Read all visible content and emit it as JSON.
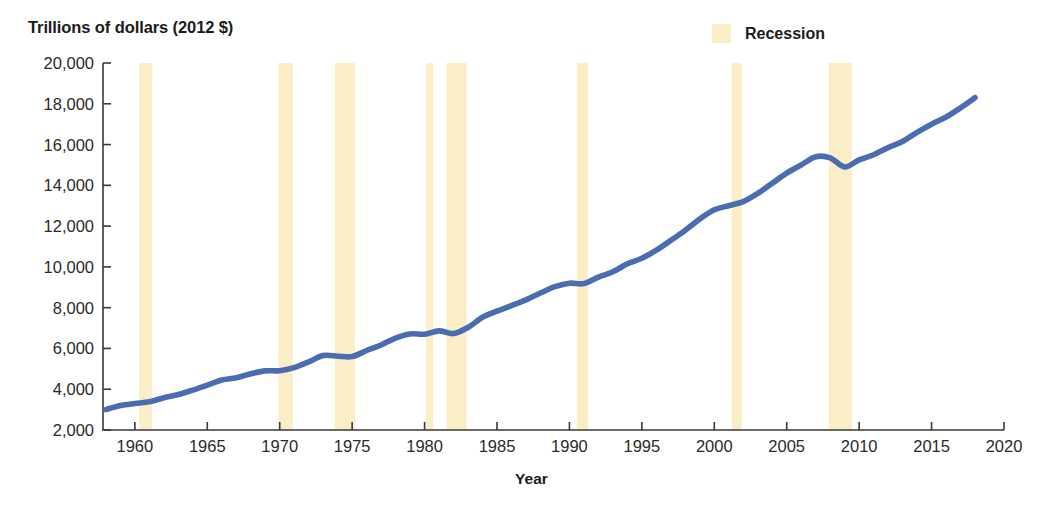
{
  "figure": {
    "y_axis_caption": "Trillions of dollars (2012 $)",
    "x_axis_title": "Year"
  },
  "legend": {
    "items": [
      {
        "label": "Recession",
        "color": "#fbeec6",
        "name": "recession"
      }
    ]
  },
  "colors": {
    "line": "#4a6cb0",
    "recession_band": "#fbeec6",
    "axis": "#3a3a3a",
    "text": "#1b1b1b"
  },
  "chart_data": {
    "type": "line",
    "title": "",
    "subtitle": "",
    "xlabel": "Year",
    "ylabel": "Trillions of dollars (2012 $)",
    "xlim": [
      1957,
      2020
    ],
    "ylim": [
      2000,
      20000
    ],
    "grid": false,
    "legend_position": "top-right",
    "y_tick_labels": [
      "20,000",
      "18,000",
      "16,000",
      "14,000",
      "12,000",
      "10,000",
      "8,000",
      "6,000",
      "4,000",
      "2,000"
    ],
    "y_ticks": [
      20000,
      18000,
      16000,
      14000,
      12000,
      10000,
      8000,
      6000,
      4000,
      2000
    ],
    "x_tick_labels": [
      "1960",
      "1965",
      "1970",
      "1975",
      "1980",
      "1985",
      "1990",
      "1995",
      "2000",
      "2005",
      "2010",
      "2015",
      "2020"
    ],
    "x_ticks": [
      1960,
      1965,
      1970,
      1975,
      1980,
      1985,
      1990,
      1995,
      2000,
      2005,
      2010,
      2015,
      2020
    ],
    "series": [
      {
        "name": "Real GDP",
        "color": "#4a6cb0",
        "x": [
          1958,
          1959,
          1960,
          1961,
          1962,
          1963,
          1964,
          1965,
          1966,
          1967,
          1968,
          1969,
          1970,
          1971,
          1972,
          1973,
          1974,
          1975,
          1976,
          1977,
          1978,
          1979,
          1980,
          1981,
          1982,
          1983,
          1984,
          1985,
          1986,
          1987,
          1988,
          1989,
          1990,
          1991,
          1992,
          1993,
          1994,
          1995,
          1996,
          1997,
          1998,
          1999,
          2000,
          2001,
          2002,
          2003,
          2004,
          2005,
          2006,
          2007,
          2008,
          2009,
          2010,
          2011,
          2012,
          2013,
          2014,
          2015,
          2016,
          2017,
          2018
        ],
        "values": [
          3000,
          3200,
          3300,
          3380,
          3580,
          3740,
          3960,
          4200,
          4450,
          4560,
          4760,
          4900,
          4910,
          5060,
          5340,
          5650,
          5620,
          5600,
          5900,
          6170,
          6510,
          6710,
          6700,
          6860,
          6730,
          7030,
          7530,
          7830,
          8100,
          8380,
          8720,
          9030,
          9200,
          9180,
          9500,
          9760,
          10150,
          10420,
          10820,
          11300,
          11800,
          12350,
          12800,
          13000,
          13200,
          13600,
          14100,
          14600,
          15000,
          15400,
          15350,
          14900,
          15250,
          15500,
          15850,
          16150,
          16600,
          17000,
          17350,
          17800,
          18300
        ]
      }
    ],
    "recessions": [
      {
        "start": 1960.3,
        "end": 1961.2,
        "label": "1960-61"
      },
      {
        "start": 1969.9,
        "end": 1970.9,
        "label": "1970"
      },
      {
        "start": 1973.8,
        "end": 1975.2,
        "label": "1973-75"
      },
      {
        "start": 1980.1,
        "end": 1980.6,
        "label": "1980"
      },
      {
        "start": 1981.5,
        "end": 1982.9,
        "label": "1981-82"
      },
      {
        "start": 1990.5,
        "end": 1991.3,
        "label": "1990-91"
      },
      {
        "start": 2001.2,
        "end": 2001.9,
        "label": "2001"
      },
      {
        "start": 2007.9,
        "end": 2009.5,
        "label": "2007-09"
      }
    ]
  }
}
